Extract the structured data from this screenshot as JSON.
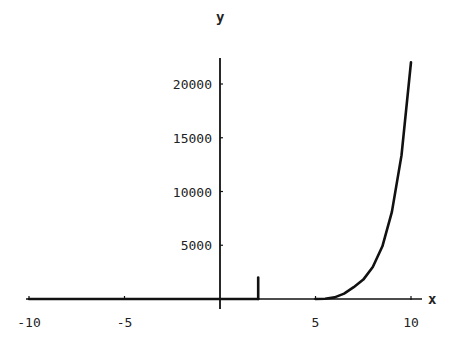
{
  "chart_data": {
    "type": "line",
    "title": "",
    "xlabel": "x",
    "ylabel": "y",
    "xlim": [
      -10.5,
      10.5
    ],
    "ylim": [
      0,
      22500
    ],
    "grid": false,
    "legend": null,
    "x_ticks": [
      -10,
      -5,
      5,
      10
    ],
    "x_tick_labels": [
      "-10",
      "-5",
      "5",
      "10"
    ],
    "y_ticks": [
      5000,
      10000,
      15000,
      20000
    ],
    "y_tick_labels": [
      "5000",
      "10000",
      "15000",
      "20000"
    ],
    "series": [
      {
        "name": "curve",
        "segments": [
          {
            "x": [
              -10,
              2
            ],
            "y": [
              0,
              0
            ]
          },
          {
            "x": [
              2,
              2
            ],
            "y": [
              0,
              2000
            ]
          },
          {
            "x": [
              5,
              5.5,
              6,
              6.5,
              7,
              7.5,
              8,
              8.5,
              9,
              9.5,
              10
            ],
            "y": [
              0,
              30,
              150,
              500,
              1100,
              1800,
              2980,
              4900,
              8100,
              13360,
              22026
            ]
          }
        ]
      }
    ],
    "annotations": []
  },
  "axis": {
    "x_label": "x",
    "y_label": "y"
  }
}
